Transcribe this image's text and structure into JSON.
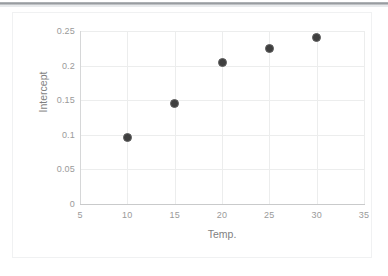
{
  "chart_data": {
    "type": "scatter",
    "title": "",
    "xlabel": "Temp.",
    "ylabel": "Intercept",
    "xlim": [
      5,
      35
    ],
    "ylim": [
      0,
      0.25
    ],
    "grid": true,
    "legend": false,
    "xticks": [
      "5",
      "10",
      "15",
      "20",
      "25",
      "30",
      "35"
    ],
    "xtick_values": [
      5,
      10,
      15,
      20,
      25,
      30,
      35
    ],
    "yticks": [
      "0",
      "0.05",
      "0.1",
      "0.15",
      "0.2",
      "0.25"
    ],
    "ytick_values": [
      0,
      0.05,
      0.1,
      0.15,
      0.2,
      0.25
    ],
    "series": [
      {
        "name": "Intercept",
        "marker": "circle",
        "color": "#3f3f3f",
        "x": [
          10,
          15,
          20,
          25,
          30
        ],
        "y": [
          0.0965,
          0.1455,
          0.2045,
          0.224,
          0.2405
        ]
      }
    ]
  },
  "style": {
    "marker_fill": "#3f3f3f",
    "marker_edge": "#5e5e5e",
    "gridline_color": "#eceded",
    "axis_color": "#c9cacb",
    "tick_label_color": "#9a9a9a",
    "axis_title_color": "#7f7f7f",
    "background": "#ffffff"
  }
}
